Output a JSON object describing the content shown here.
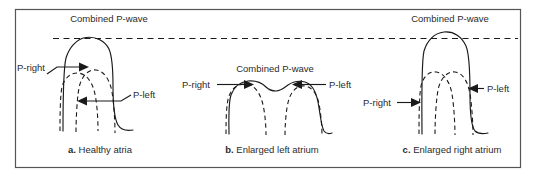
{
  "figure": {
    "title": "",
    "reference_line_label": "",
    "panels": [
      {
        "id": "a",
        "combined_label": "Combined P-wave",
        "left_label": "P-right",
        "right_label": "P-left",
        "caption_letter": "a.",
        "caption_text": " Healthy atria"
      },
      {
        "id": "b",
        "combined_label": "Combined P-wave",
        "left_label": "P-right",
        "right_label": "P-left",
        "caption_letter": "b.",
        "caption_text": " Enlarged left atrium"
      },
      {
        "id": "c",
        "combined_label": "Combined P-wave",
        "left_label": "P-right",
        "right_label": "P-left",
        "caption_letter": "c.",
        "caption_text": " Enlarged right atrium"
      }
    ]
  },
  "colors": {
    "ink": "#1a1a1a",
    "text": "#2b2b2b",
    "frame": "#555555",
    "background": "#ffffff"
  }
}
